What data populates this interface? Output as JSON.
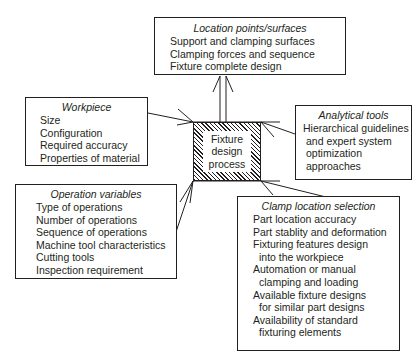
{
  "center": {
    "lines": [
      "Fixture",
      "design",
      "process"
    ]
  },
  "location": {
    "title": "Location points/surfaces",
    "items": [
      "Support and clamping surfaces",
      "Clamping forces and sequence",
      "Fixture complete design"
    ]
  },
  "workpiece": {
    "title": "Workpiece",
    "items": [
      "Size",
      "Configuration",
      "Required accuracy",
      "Properties of material"
    ]
  },
  "analytical": {
    "title": "Analytical tools",
    "items": [
      "Hierarchical guidelines",
      "and expert system",
      "optimization",
      "approaches"
    ]
  },
  "operation": {
    "title": "Operation variables",
    "items": [
      "Type of operations",
      "Number of operations",
      "Sequence of operations",
      "Machine tool characteristics",
      "Cutting tools",
      "Inspection requirement"
    ]
  },
  "clamp": {
    "title": "Clamp location selection",
    "items": [
      "Part location accuracy",
      "Part stablity and deformation",
      "Fixturing features design",
      "into the workpiece",
      "Automation or manual",
      "clamping and loading",
      "Available fixture designs",
      "for similar part designs",
      "Availability of standard",
      "fixturing elements"
    ]
  }
}
